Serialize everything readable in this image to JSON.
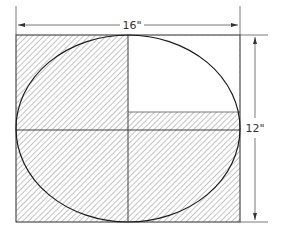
{
  "diagram": {
    "width_label": "16\"",
    "height_label": "12\"",
    "colors": {
      "line": "#2a2a2a",
      "hatch": "#8a8a8a",
      "background": "#ffffff"
    },
    "rectangle": {
      "x": 16,
      "y": 35,
      "w": 224,
      "h": 187
    },
    "ellipse": {
      "cx": 128,
      "cy": 128,
      "rx": 112,
      "ry": 93
    },
    "divider_x": 128,
    "midline_y": 130,
    "unhatched_region": {
      "x": 128,
      "y": 35,
      "w": 112,
      "h": 77
    }
  }
}
